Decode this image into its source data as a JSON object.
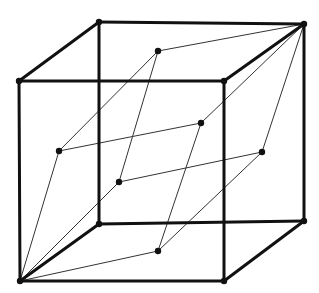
{
  "diagram": {
    "title": "",
    "width": 319,
    "height": 293,
    "colors": {
      "cube_edge": "#111111",
      "inner_edge": "#333333",
      "vertex": "#111111",
      "background": "#ffffff"
    },
    "cube_vertices": {
      "back_top_left": [
        99,
        22
      ],
      "back_top_right": [
        304,
        24
      ],
      "back_bottom_left": [
        99,
        224
      ],
      "back_bottom_right": [
        304,
        221
      ],
      "front_top_left": [
        19,
        81
      ],
      "front_top_right": [
        224,
        81
      ],
      "front_bottom_left": [
        20,
        281
      ],
      "front_bottom_right": [
        224,
        281
      ]
    },
    "cube_edges": [
      [
        "back_top_left",
        "back_top_right"
      ],
      [
        "back_top_left",
        "back_bottom_left"
      ],
      [
        "back_top_right",
        "back_bottom_right"
      ],
      [
        "back_bottom_left",
        "back_bottom_right"
      ],
      [
        "front_top_left",
        "front_top_right"
      ],
      [
        "front_top_left",
        "front_bottom_left"
      ],
      [
        "front_top_right",
        "front_bottom_right"
      ],
      [
        "front_bottom_left",
        "front_bottom_right"
      ],
      [
        "back_top_left",
        "front_top_left"
      ],
      [
        "back_top_right",
        "front_top_right"
      ],
      [
        "back_bottom_left",
        "front_bottom_left"
      ],
      [
        "back_bottom_right",
        "front_bottom_right"
      ]
    ],
    "inner_vertices": {
      "p1": [
        158,
        51
      ],
      "p2": [
        201,
        123
      ],
      "p3": [
        59,
        151
      ],
      "p4": [
        262,
        152
      ],
      "p5": [
        119,
        182
      ],
      "p6": [
        158,
        251
      ]
    },
    "inner_edges": [
      [
        "back_top_right",
        "p1"
      ],
      [
        "back_top_right",
        "p2"
      ],
      [
        "back_top_right",
        "p4"
      ],
      [
        "front_bottom_left",
        "p3"
      ],
      [
        "front_bottom_left",
        "p5"
      ],
      [
        "front_bottom_left",
        "p6"
      ],
      [
        "p1",
        "p3"
      ],
      [
        "p1",
        "p5"
      ],
      [
        "p2",
        "p3"
      ],
      [
        "p2",
        "p6"
      ],
      [
        "p4",
        "p5"
      ],
      [
        "p4",
        "p6"
      ]
    ],
    "dot_vertices": [
      "back_top_left",
      "back_top_right",
      "back_bottom_left",
      "back_bottom_right",
      "front_top_left",
      "front_top_right",
      "front_bottom_left",
      "front_bottom_right",
      "p1",
      "p2",
      "p3",
      "p4",
      "p5",
      "p6"
    ]
  }
}
